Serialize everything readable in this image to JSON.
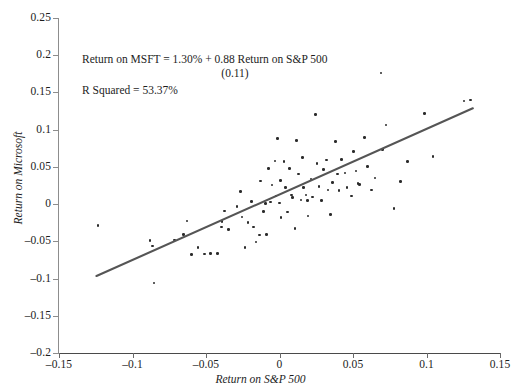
{
  "chart_data": {
    "type": "scatter",
    "title": "",
    "xlabel": "Return on S&P 500",
    "ylabel": "Return on Microsoft",
    "xlim": [
      -0.15,
      0.15
    ],
    "ylim": [
      -0.2,
      0.25
    ],
    "grid": false,
    "legend": null,
    "xticks": [
      "-0.15",
      "-0.1",
      "-0.05",
      "0",
      "0.05",
      "0.1",
      "0.15"
    ],
    "xtick_values": [
      -0.15,
      -0.1,
      -0.05,
      0,
      0.05,
      0.1,
      0.15
    ],
    "yticks": [
      "0.25",
      "0.2",
      "0.15",
      "0.1",
      "0.05",
      "0",
      "-0.05",
      "-0.1",
      "-0.15",
      "-0.2"
    ],
    "ytick_values": [
      0.25,
      0.2,
      0.15,
      0.1,
      0.05,
      0,
      -0.05,
      -0.1,
      -0.15,
      -0.2
    ],
    "annotations": {
      "equation": "Return on MSFT = 1.30% + 0.88 Return on S&P 500",
      "std_error": "(0.11)",
      "r_squared": "R Squared = 53.37%"
    },
    "regression": {
      "intercept": 0.013,
      "slope": 0.88,
      "slope_std_error": 0.11,
      "r_squared": 0.5337,
      "color": "#555555",
      "x_start": -0.1245,
      "x_end": 0.1315
    },
    "marker_color": "#2b2b2b",
    "series": [
      {
        "name": "Monthly returns",
        "points": [
          [
            -0.1235,
            -0.029
          ],
          [
            -0.088,
            -0.0485
          ],
          [
            -0.0865,
            -0.0565
          ],
          [
            -0.0855,
            -0.106
          ],
          [
            -0.0715,
            -0.048
          ],
          [
            -0.0655,
            -0.0405
          ],
          [
            -0.063,
            -0.0225
          ],
          [
            -0.06,
            -0.068
          ],
          [
            -0.0555,
            -0.058
          ],
          [
            -0.051,
            -0.067
          ],
          [
            -0.047,
            -0.0665
          ],
          [
            -0.042,
            -0.0665
          ],
          [
            -0.0395,
            -0.031
          ],
          [
            -0.039,
            -0.0235
          ],
          [
            -0.0375,
            -0.009
          ],
          [
            -0.0345,
            -0.0345
          ],
          [
            -0.029,
            -0.003
          ],
          [
            -0.0265,
            0.017
          ],
          [
            -0.0255,
            -0.0175
          ],
          [
            -0.0235,
            -0.058
          ],
          [
            -0.0215,
            -0.0245
          ],
          [
            -0.019,
            0.0035
          ],
          [
            -0.0175,
            -0.031
          ],
          [
            -0.016,
            -0.051
          ],
          [
            -0.0135,
            -0.0415
          ],
          [
            -0.013,
            0.031
          ],
          [
            -0.011,
            -0.01
          ],
          [
            -0.0095,
            0.001
          ],
          [
            -0.009,
            -0.041
          ],
          [
            -0.0075,
            0.048
          ],
          [
            -0.006,
            0.003
          ],
          [
            -0.005,
            0.0255
          ],
          [
            -0.003,
            0.058
          ],
          [
            -0.0025,
            0.011
          ],
          [
            -0.0015,
            0.0885
          ],
          [
            0.0,
            0.0015
          ],
          [
            0.0005,
            0.032
          ],
          [
            0.001,
            -0.018
          ],
          [
            0.003,
            0.0575
          ],
          [
            0.004,
            0.022
          ],
          [
            0.0055,
            -0.0105
          ],
          [
            0.007,
            0.048
          ],
          [
            0.008,
            0.0125
          ],
          [
            0.009,
            0.009
          ],
          [
            0.0105,
            -0.033
          ],
          [
            0.0115,
            0.0855
          ],
          [
            0.013,
            0.0405
          ],
          [
            0.0145,
            0.0055
          ],
          [
            0.0155,
            0.063
          ],
          [
            0.0165,
            0.0225
          ],
          [
            0.018,
            0.012
          ],
          [
            0.019,
            0.005
          ],
          [
            0.0195,
            -0.016
          ],
          [
            0.0215,
            0.034
          ],
          [
            0.0225,
            0.0095
          ],
          [
            0.0245,
            0.12
          ],
          [
            0.0255,
            0.0545
          ],
          [
            0.027,
            0.0235
          ],
          [
            0.0285,
            0.005
          ],
          [
            0.03,
            0.0465
          ],
          [
            0.032,
            0.0595
          ],
          [
            0.033,
            0.019
          ],
          [
            0.0345,
            -0.014
          ],
          [
            0.036,
            0.029
          ],
          [
            0.038,
            0.0845
          ],
          [
            0.0395,
            0.0405
          ],
          [
            0.0405,
            0.0185
          ],
          [
            0.042,
            0.06
          ],
          [
            0.0445,
            0.042
          ],
          [
            0.046,
            0.0225
          ],
          [
            0.049,
            0.011
          ],
          [
            0.0505,
            0.0705
          ],
          [
            0.052,
            0.0445
          ],
          [
            0.0535,
            0.0275
          ],
          [
            0.0545,
            0.0265
          ],
          [
            0.058,
            0.0895
          ],
          [
            0.06,
            0.0505
          ],
          [
            0.0625,
            0.019
          ],
          [
            0.065,
            0.035
          ],
          [
            0.069,
            0.176
          ],
          [
            0.07,
            0.073
          ],
          [
            0.0725,
            0.1065
          ],
          [
            0.078,
            -0.006
          ],
          [
            0.0825,
            0.0305
          ],
          [
            0.087,
            0.0575
          ],
          [
            0.0985,
            0.1215
          ],
          [
            0.1045,
            0.064
          ],
          [
            0.1255,
            0.1385
          ],
          [
            0.13,
            0.14
          ]
        ]
      }
    ]
  }
}
